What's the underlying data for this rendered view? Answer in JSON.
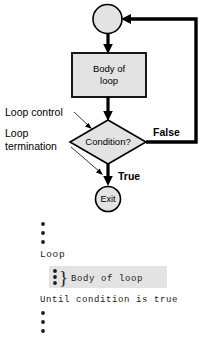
{
  "figure": {
    "type": "flowchart",
    "background_color": "#ffffff",
    "shape_fill_color": "#e3e3e3",
    "line_color": "#000000"
  },
  "flowchart": {
    "entry_node": {
      "shape": "circle",
      "label": ""
    },
    "process_node": {
      "shape": "rectangle",
      "label_line1": "Body of",
      "label_line2": "loop"
    },
    "decision_node": {
      "shape": "diamond",
      "label": "Condition?"
    },
    "exit_node": {
      "shape": "circle",
      "label": "Exit"
    },
    "branches": {
      "false_label": "False",
      "true_label": "True"
    },
    "annotations": [
      {
        "label": "Loop control"
      },
      {
        "label_line1": "Loop",
        "label_line2": "termination"
      }
    ]
  },
  "pseudocode": {
    "ellipsis_top": "•••",
    "line_loop": "Loop",
    "highlighted_line": "Body of loop",
    "brace": "}",
    "line_until": "Until condition is true",
    "ellipsis_bottom": "•••"
  }
}
